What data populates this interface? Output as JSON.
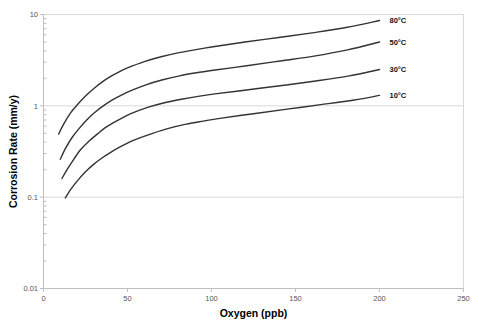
{
  "chart_data": {
    "type": "line",
    "title": "",
    "xlabel": "Oxygen (ppb)",
    "ylabel": "Corrosion Rate (mm/y)",
    "xlim": [
      0,
      250
    ],
    "ylim": [
      0.01,
      10
    ],
    "yscale": "log",
    "xscale": "linear",
    "grid": true,
    "grid_axis": "y",
    "legend_position": "inline-right-end-of-line",
    "xticks": [
      0,
      50,
      100,
      150,
      200,
      250
    ],
    "xtick_labels": [
      "0",
      "50",
      "100",
      "150",
      "200",
      "250"
    ],
    "yticks": [
      0.01,
      0.1,
      1,
      10
    ],
    "ytick_labels": [
      "0.01",
      "0.1",
      "1",
      "10"
    ],
    "series": [
      {
        "name": "80°C",
        "label": "80°C",
        "color": "#333333",
        "x": [
          9,
          12,
          16,
          20,
          25,
          30,
          35,
          40,
          45,
          50,
          60,
          70,
          80,
          90,
          100,
          120,
          140,
          160,
          180,
          200
        ],
        "y": [
          0.49,
          0.63,
          0.83,
          1.02,
          1.28,
          1.55,
          1.83,
          2.1,
          2.36,
          2.6,
          3.05,
          3.45,
          3.8,
          4.1,
          4.4,
          5.0,
          5.6,
          6.3,
          7.2,
          8.6
        ]
      },
      {
        "name": "50°C",
        "label": "50°C",
        "color": "#333333",
        "x": [
          10,
          13,
          17,
          21,
          26,
          31,
          36,
          41,
          46,
          51,
          61,
          71,
          81,
          91,
          101,
          121,
          141,
          161,
          181,
          200
        ],
        "y": [
          0.26,
          0.34,
          0.45,
          0.56,
          0.71,
          0.86,
          1.01,
          1.16,
          1.3,
          1.44,
          1.7,
          1.93,
          2.13,
          2.3,
          2.45,
          2.75,
          3.1,
          3.5,
          4.1,
          5.0
        ]
      },
      {
        "name": "30°C",
        "label": "30°C",
        "color": "#333333",
        "x": [
          11,
          14,
          18,
          22,
          27,
          32,
          37,
          42,
          47,
          52,
          62,
          72,
          82,
          92,
          102,
          122,
          142,
          162,
          182,
          200
        ],
        "y": [
          0.16,
          0.2,
          0.26,
          0.33,
          0.41,
          0.49,
          0.58,
          0.66,
          0.74,
          0.82,
          0.96,
          1.08,
          1.18,
          1.27,
          1.35,
          1.5,
          1.67,
          1.87,
          2.13,
          2.5
        ]
      },
      {
        "name": "10°C",
        "label": "10°C",
        "color": "#333333",
        "x": [
          13,
          16,
          20,
          25,
          30,
          35,
          40,
          45,
          50,
          55,
          65,
          75,
          85,
          95,
          105,
          125,
          145,
          165,
          185,
          200
        ],
        "y": [
          0.098,
          0.12,
          0.15,
          0.19,
          0.23,
          0.27,
          0.31,
          0.35,
          0.39,
          0.43,
          0.5,
          0.57,
          0.63,
          0.68,
          0.73,
          0.82,
          0.92,
          1.03,
          1.16,
          1.3
        ]
      }
    ],
    "colors": {
      "curve": "#333333",
      "grid": "#d9d9d9",
      "axis": "#bfbfbf",
      "tick_text": "#555555",
      "title_text": "#000000",
      "background": "#ffffff"
    }
  }
}
